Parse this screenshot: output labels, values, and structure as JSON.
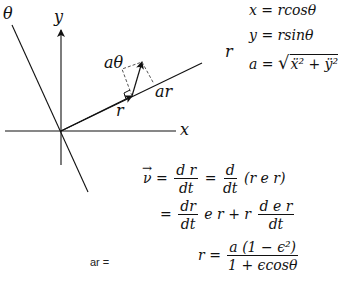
{
  "diagram": {
    "axis_labels": {
      "x": "x",
      "y": "y",
      "theta": "θ",
      "r_line": "r"
    },
    "vector_labels": {
      "r": "r",
      "a_theta": "aθ",
      "a_r": "ar"
    },
    "colors": {
      "stroke": "#111111",
      "dashed": "#555555",
      "background": "#ffffff"
    }
  },
  "equations": {
    "x_eq": {
      "lhs": "x",
      "rhs": "= rcosθ"
    },
    "y_eq": {
      "lhs": "y",
      "rhs": "= rsinθ"
    },
    "a_eq": {
      "lhs": "a",
      "eq": "=",
      "sqrt_sym": "√",
      "radicand": "ẍ² + ÿ²"
    },
    "v_eq": {
      "lhs": "ν",
      "eq1": "=",
      "frac1_num": "d r",
      "frac1_den": "dt",
      "eq2": "=",
      "frac2_num": "d",
      "frac2_den": "dt",
      "paren": "(r e r)"
    },
    "v_eq2": {
      "eq": "=",
      "frac1_num": "dr",
      "frac1_den": "dt",
      "mid": "e r + r",
      "frac2_num": "d e r",
      "frac2_den": "dt"
    },
    "ar_label": "ar =",
    "r_eq": {
      "lhs": "r",
      "eq": "=",
      "num": "a (1 − ϵ²)",
      "den": "1 + ϵcosθ"
    }
  }
}
